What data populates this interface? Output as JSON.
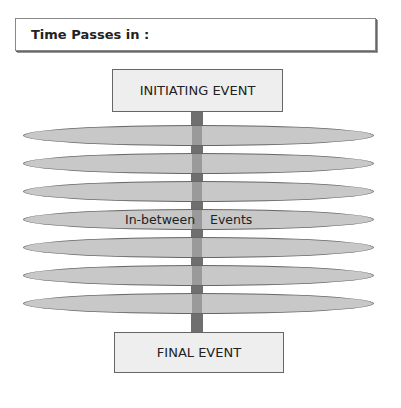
{
  "header": {
    "title": "Time Passes in :"
  },
  "diagram": {
    "initiating_event": "INITIATING EVENT",
    "final_event": "FINAL EVENT",
    "middle_labels": {
      "left": "In-between",
      "right": "Events"
    },
    "bar_count": 7,
    "colors": {
      "bar_fill": "#c8c8c8",
      "bar_border": "#666666",
      "pole": "#6f6f6f",
      "pole_in_bar": "#9a9a9a",
      "box_fill": "#eeeeee"
    }
  }
}
